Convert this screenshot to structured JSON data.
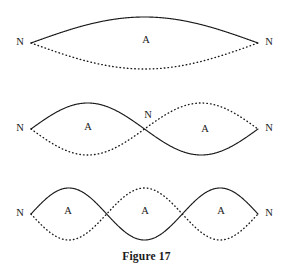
{
  "figure": {
    "caption": "Figure 17",
    "caption_y": 250,
    "width": 293,
    "height": 271,
    "background_color": "#ffffff",
    "ink_color": "#1a1a1a"
  },
  "labels": {
    "node": "N",
    "antinode": "A"
  },
  "chart_data": {
    "type": "line",
    "title": "Figure 17",
    "subtitle": "",
    "xlabel": "",
    "ylabel": "",
    "grid": false,
    "legend": "none",
    "x_start": 31,
    "x_end": 258,
    "amplitude": 26,
    "series": [
      {
        "name": "fundamental",
        "harmonic": 1,
        "loops": 1,
        "axis_y": 43,
        "nodes": [
          {
            "x": 31,
            "y": 43,
            "label": "N",
            "label_x": 20,
            "label_y": 43
          },
          {
            "x": 258,
            "y": 43,
            "label": "N",
            "label_x": 269,
            "label_y": 43
          }
        ],
        "antinodes": [
          {
            "x": 146,
            "y": 41,
            "label": "A"
          }
        ],
        "curves": [
          {
            "style": "solid",
            "phase_sign": 1
          },
          {
            "style": "dotted",
            "phase_sign": -1
          }
        ]
      },
      {
        "name": "second-harmonic",
        "harmonic": 2,
        "loops": 2,
        "axis_y": 129,
        "nodes": [
          {
            "x": 31,
            "y": 129,
            "label": "N",
            "label_x": 20,
            "label_y": 129
          },
          {
            "x": 144.5,
            "y": 129,
            "label": "N",
            "label_x": 148,
            "label_y": 116
          },
          {
            "x": 258,
            "y": 129,
            "label": "N",
            "label_x": 269,
            "label_y": 129
          }
        ],
        "antinodes": [
          {
            "x": 88,
            "y": 128,
            "label": "A"
          },
          {
            "x": 205,
            "y": 130,
            "label": "A"
          }
        ],
        "curves": [
          {
            "style": "solid",
            "phase_sign": 1
          },
          {
            "style": "dotted",
            "phase_sign": -1
          }
        ]
      },
      {
        "name": "third-harmonic",
        "harmonic": 3,
        "loops": 3,
        "axis_y": 214,
        "nodes": [
          {
            "x": 31,
            "y": 214,
            "label": "N",
            "label_x": 20,
            "label_y": 214
          },
          {
            "x": 106.7,
            "y": 214,
            "label": "",
            "label_x": 0,
            "label_y": 0
          },
          {
            "x": 182.3,
            "y": 214,
            "label": "",
            "label_x": 0,
            "label_y": 0
          },
          {
            "x": 258,
            "y": 214,
            "label": "N",
            "label_x": 269,
            "label_y": 214
          }
        ],
        "antinodes": [
          {
            "x": 68,
            "y": 212,
            "label": "A"
          },
          {
            "x": 145,
            "y": 212,
            "label": "A"
          },
          {
            "x": 221,
            "y": 212,
            "label": "A"
          }
        ],
        "curves": [
          {
            "style": "solid",
            "phase_sign": 1
          },
          {
            "style": "dotted",
            "phase_sign": -1
          }
        ]
      }
    ]
  }
}
